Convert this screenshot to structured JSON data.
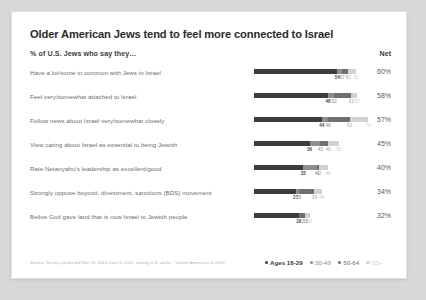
{
  "card": {
    "title": "Older American Jews tend to feel more connected to Israel",
    "subtitle": "% of U.S. Jews who say they…",
    "net_header": "Net",
    "source": "Source: Survey conducted Nov 19, 2019-June 3, 2020, among U.S. adults.\n\"Jewish Americans in 2020\""
  },
  "legend": {
    "items": [
      {
        "label": "Ages 18-29",
        "color": "#3c3c3c"
      },
      {
        "label": "30-49",
        "color": "#8e8e8e"
      },
      {
        "label": "50-64",
        "color": "#6f6f6f"
      },
      {
        "label": "65+",
        "color": "#d2d2d2"
      }
    ]
  },
  "chart_data": {
    "type": "bar",
    "title": "Older American Jews tend to feel more connected to Israel",
    "subtitle": "% of U.S. Jews who say they…",
    "xlabel": "",
    "ylabel": "",
    "xlim": [
      0,
      70
    ],
    "grid": false,
    "legend_position": "bottom-right",
    "series": [
      {
        "name": "Ages 18-29",
        "color": "#3c3c3c"
      },
      {
        "name": "30-49",
        "color": "#8e8e8e"
      },
      {
        "name": "50-64",
        "color": "#6f6f6f"
      },
      {
        "name": "65+",
        "color": "#d2d2d2"
      }
    ],
    "categories": [
      "Have a lot/some in common with Jews in Israel",
      "Feel very/somewhat attached to Israel",
      "Follow news about Israel very/somewhat closely",
      "View caring about Israel as essential to being Jewish",
      "Rate Netanyahu's leadership as excellent/good",
      "Strongly oppose boycott, divestment, sanctions (BDS) movement",
      "Belive God gave land that is now Israel to Jewish people"
    ],
    "net": [
      "60%",
      "58%",
      "57%",
      "45%",
      "40%",
      "34%",
      "32%"
    ],
    "rows": [
      {
        "category": "Have a lot/some in common with Jews in Israel",
        "net": "60%",
        "values": [
          54,
          57,
          61,
          66
        ],
        "labels": [
          "54",
          "57",
          "61",
          "66"
        ]
      },
      {
        "category": "Feel very/somewhat attached to Israel",
        "net": "58%",
        "values": [
          48,
          52,
          63,
          67
        ],
        "labels": [
          "48",
          "52",
          "63",
          "67"
        ]
      },
      {
        "category": "Follow news about Israel very/somewhat closely",
        "net": "57%",
        "values": [
          44,
          48,
          62,
          74
        ],
        "labels": [
          "44",
          "48",
          "62",
          "74"
        ]
      },
      {
        "category": "View caring about Israel as essential to being Jewish",
        "net": "45%",
        "values": [
          36,
          43,
          48,
          55
        ],
        "labels": [
          "36",
          "43",
          "48",
          "55"
        ]
      },
      {
        "category": "Rate Netanyahu's leadership as excellent/good",
        "net": "40%",
        "values": [
          32,
          41,
          42,
          48
        ],
        "labels": [
          "32",
          "41",
          "42",
          "48"
        ]
      },
      {
        "category": "Strongly oppose boycott, divestment, sanctions (BDS) movement",
        "net": "34%",
        "values": [
          27,
          29,
          39,
          44
        ],
        "labels": [
          "27",
          "29",
          "39",
          "44"
        ]
      },
      {
        "category": "Belive God gave land that is now Israel to Jewish people",
        "net": "32%",
        "values": [
          29,
          33,
          33,
          36
        ],
        "labels": [
          "29",
          "33",
          "33",
          "36"
        ]
      }
    ]
  }
}
